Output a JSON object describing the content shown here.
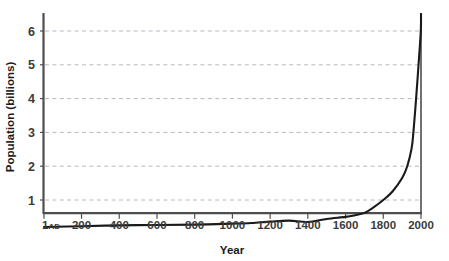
{
  "chart_data": {
    "type": "line",
    "title": "",
    "xlabel": "Year",
    "ylabel": "Population (billions)",
    "xlim": [
      1,
      2000
    ],
    "ylim": [
      0,
      6.8
    ],
    "grid": true,
    "legend": null,
    "x_ticks": [
      {
        "value": 1,
        "label": "1",
        "suffix": "AD"
      },
      {
        "value": 200,
        "label": "200",
        "suffix": ""
      },
      {
        "value": 400,
        "label": "400",
        "suffix": ""
      },
      {
        "value": 600,
        "label": "600",
        "suffix": ""
      },
      {
        "value": 800,
        "label": "800",
        "suffix": ""
      },
      {
        "value": 1000,
        "label": "1000",
        "suffix": ""
      },
      {
        "value": 1200,
        "label": "1200",
        "suffix": ""
      },
      {
        "value": 1400,
        "label": "1400",
        "suffix": ""
      },
      {
        "value": 1600,
        "label": "1600",
        "suffix": ""
      },
      {
        "value": 1800,
        "label": "1800",
        "suffix": ""
      },
      {
        "value": 2000,
        "label": "2000",
        "suffix": ""
      }
    ],
    "y_ticks": [
      {
        "value": 1,
        "label": "1"
      },
      {
        "value": 2,
        "label": "2"
      },
      {
        "value": 3,
        "label": "3"
      },
      {
        "value": 4,
        "label": "4"
      },
      {
        "value": 5,
        "label": "5"
      },
      {
        "value": 6,
        "label": "6"
      }
    ],
    "series": [
      {
        "name": "World population",
        "color": "#1a1a1a",
        "x": [
          1,
          200,
          400,
          600,
          800,
          1000,
          1100,
          1200,
          1300,
          1400,
          1500,
          1600,
          1650,
          1700,
          1750,
          1800,
          1850,
          1900,
          1927,
          1950,
          1960,
          1974,
          1987,
          1999,
          2000
        ],
        "y": [
          0.2,
          0.223,
          0.25,
          0.26,
          0.27,
          0.3,
          0.32,
          0.36,
          0.39,
          0.35,
          0.44,
          0.5,
          0.55,
          0.62,
          0.79,
          1.0,
          1.26,
          1.65,
          2.0,
          2.52,
          3.02,
          4.0,
          5.0,
          6.0,
          6.5
        ]
      }
    ],
    "colors": {
      "curve": "#1a1a1a",
      "axis": "#4d4d4d",
      "gridline": "#b8b8c4",
      "text": "#3b3b3b",
      "background": "#ffffff"
    }
  }
}
